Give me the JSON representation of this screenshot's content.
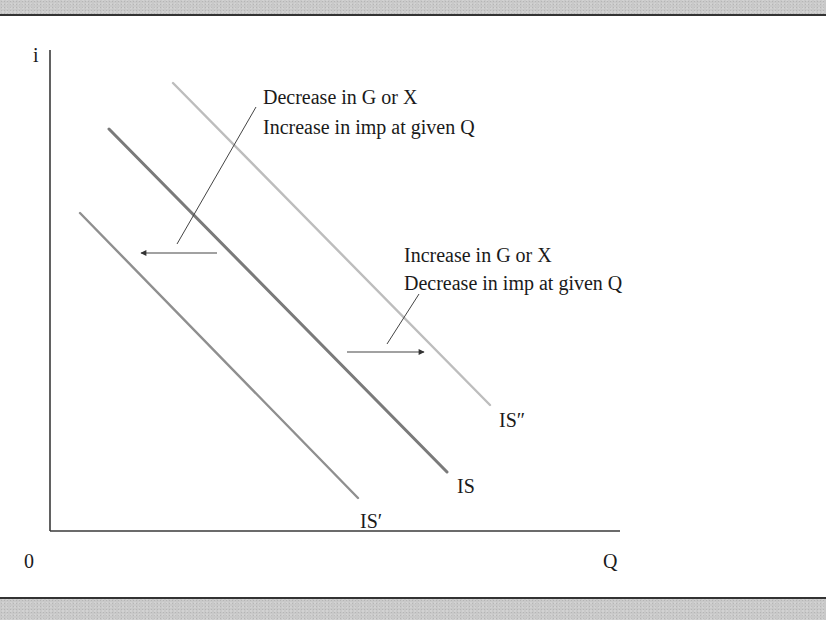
{
  "figure": {
    "type": "IS curve shift diagram",
    "axes": {
      "y_label": "i",
      "x_label": "Q",
      "origin_label": "0"
    },
    "curves": [
      {
        "id": "is-prime",
        "label": "IS′",
        "color": "#8f8f8f",
        "description": "IS curve shifted left"
      },
      {
        "id": "is",
        "label": "IS",
        "color": "#7a7a7a",
        "description": "original IS curve"
      },
      {
        "id": "is-double-prime",
        "label": "IS″",
        "color": "#bdbdbd",
        "description": "IS curve shifted right"
      }
    ],
    "annotations": {
      "left_shift": {
        "line1": "Decrease in G or X",
        "line2": "Increase in imp at given Q",
        "direction": "left"
      },
      "right_shift": {
        "line1": "Increase in G or X",
        "line2": "Decrease in imp at given Q",
        "direction": "right"
      }
    },
    "colors": {
      "axis": "#3a3a3a",
      "arrow": "#444444",
      "text": "#1a1a1a",
      "band": "#c9c9c9"
    }
  }
}
